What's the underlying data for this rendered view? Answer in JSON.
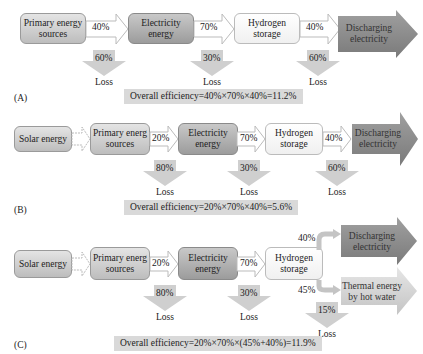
{
  "panels": {
    "A": {
      "label": "(A)",
      "nodes": [
        "Primary energy sources",
        "Electricity energy",
        "Hydrogen storage",
        "Discharging electricity"
      ],
      "node_lines": [
        [
          "Primary energy",
          "sources"
        ],
        [
          "Electricity",
          "energy"
        ],
        [
          "Hydrogen",
          "storage"
        ],
        [
          "Discharging",
          "electricity"
        ]
      ],
      "transfers": [
        "40%",
        "70%",
        "40%"
      ],
      "losses": [
        "60%",
        "30%",
        "60%"
      ],
      "loss_label": "Loss",
      "efficiency": "Overall efficiency=40%×70%×40%=11.2%"
    },
    "B": {
      "label": "(B)",
      "nodes": [
        "Solar energy",
        "Primary energ sources",
        "Electricity energy",
        "Hydrogen storage",
        "Discharging electricity"
      ],
      "node_lines": [
        [
          "Solar energy"
        ],
        [
          "Primary energ",
          "sources"
        ],
        [
          "Electricity",
          "energy"
        ],
        [
          "Hydrogen",
          "storage"
        ],
        [
          "Discharging",
          "electricity"
        ]
      ],
      "transfers": [
        "20%",
        "70%",
        "40%"
      ],
      "losses": [
        "80%",
        "30%",
        "60%"
      ],
      "loss_label": "Loss",
      "efficiency": "Overall efficiency=20%×70%×40%=5.6%"
    },
    "C": {
      "label": "(C)",
      "nodes": [
        "Solar energy",
        "Primary energ sources",
        "Electricity energy",
        "Hydrogen storage",
        "Discharging electricity",
        "Thermal energy by hot water"
      ],
      "node_lines": [
        [
          "Solar energy"
        ],
        [
          "Primary energ",
          "sources"
        ],
        [
          "Electricity",
          "energy"
        ],
        [
          "Hydrogen",
          "storage"
        ],
        [
          "Discharging",
          "electricity"
        ],
        [
          "Thermal energy",
          "by hot water"
        ]
      ],
      "transfers": [
        "20%",
        "70%",
        "40%",
        "45%"
      ],
      "losses": [
        "80%",
        "30%",
        "15%"
      ],
      "loss_label": "Loss",
      "efficiency": "Overall efficiency=20%×70%×(45%+40%)=11.9%"
    }
  },
  "colors": {
    "light_box": "#d6d6d6",
    "dark_box": "#a8a8a8",
    "white_box": "#f8f8f8",
    "dark_arrow": "#8c8c8c",
    "light_arrow": "#cfcfcf",
    "efficiency_bg": "#d9d9d9"
  }
}
